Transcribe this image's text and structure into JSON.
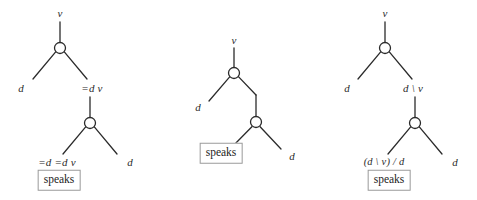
{
  "figure": {
    "kind": "categorial-grammar-derivation-trees",
    "background_color": "#ffffff",
    "stroke_color": "#2b2b2b",
    "text_color": "#2b2b2b",
    "box_border_color": "#9a9a9a"
  },
  "trees": [
    {
      "id": "tree-1",
      "notation": "equals-slash",
      "nodes": [
        {
          "name": "root-node",
          "cx": 60,
          "cy": 48,
          "r": 5.5
        },
        {
          "name": "lower-node",
          "cx": 90,
          "cy": 123,
          "r": 5.5
        }
      ],
      "labels": {
        "root_top": "v",
        "root_left": "d",
        "root_right": "=d v",
        "lower_left": "=d =d v",
        "lower_right": "d",
        "terminal": "speaks"
      },
      "label_positions": {
        "root_top": {
          "x": 60,
          "y": 13
        },
        "root_left": {
          "x": 21,
          "y": 88
        },
        "root_right": {
          "x": 92,
          "y": 88
        },
        "lower_left": {
          "x": 57,
          "y": 162
        },
        "lower_right": {
          "x": 130,
          "y": 162
        },
        "terminal": {
          "x": 59,
          "y": 180
        }
      }
    },
    {
      "id": "tree-2",
      "notation": "bare",
      "nodes": [
        {
          "name": "root-node",
          "cx": 234,
          "cy": 73,
          "r": 5.5
        },
        {
          "name": "lower-node",
          "cx": 256,
          "cy": 122,
          "r": 5.5
        }
      ],
      "labels": {
        "root_top": "v",
        "root_left": "d",
        "lower_right": "d",
        "terminal": "speaks"
      },
      "label_positions": {
        "root_top": {
          "x": 234,
          "y": 40
        },
        "root_left": {
          "x": 198,
          "y": 107
        },
        "lower_right": {
          "x": 292,
          "y": 156
        },
        "terminal": {
          "x": 221,
          "y": 153
        }
      }
    },
    {
      "id": "tree-3",
      "notation": "slash",
      "nodes": [
        {
          "name": "root-node",
          "cx": 385,
          "cy": 48,
          "r": 5.5
        },
        {
          "name": "lower-node",
          "cx": 415,
          "cy": 123,
          "r": 5.5
        }
      ],
      "labels": {
        "root_top": "v",
        "root_left": "d",
        "root_right": "d \\ v",
        "lower_left": "(d \\ v) / d",
        "lower_right": "d",
        "terminal": "speaks"
      },
      "label_positions": {
        "root_top": {
          "x": 385,
          "y": 13
        },
        "root_left": {
          "x": 347,
          "y": 88
        },
        "root_right": {
          "x": 413,
          "y": 88
        },
        "lower_left": {
          "x": 384,
          "y": 162
        },
        "lower_right": {
          "x": 455,
          "y": 162
        },
        "terminal": {
          "x": 389,
          "y": 180
        }
      }
    }
  ]
}
